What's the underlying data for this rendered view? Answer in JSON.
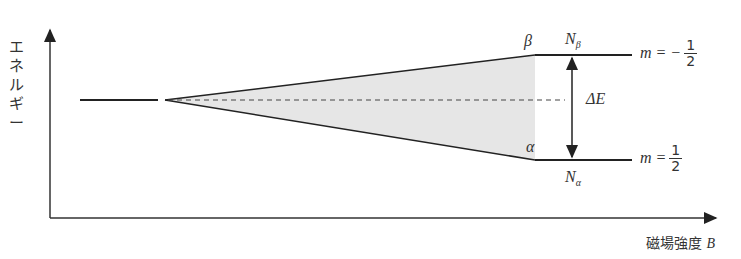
{
  "diagram": {
    "y_axis_label": "エネルギー",
    "x_axis_label": "磁場強度",
    "x_axis_symbol": "B",
    "upper_state": {
      "greek": "β",
      "population": "N",
      "population_sub": "β",
      "m_label": "m = −",
      "m_num": "1",
      "m_den": "2"
    },
    "lower_state": {
      "greek": "α",
      "population": "N",
      "population_sub": "α",
      "m_label": "m =",
      "m_num": "1",
      "m_den": "2"
    },
    "gap_label": "ΔE",
    "colors": {
      "line": "#222222",
      "fill": "#e6e6e6",
      "dashed": "#444444"
    }
  }
}
